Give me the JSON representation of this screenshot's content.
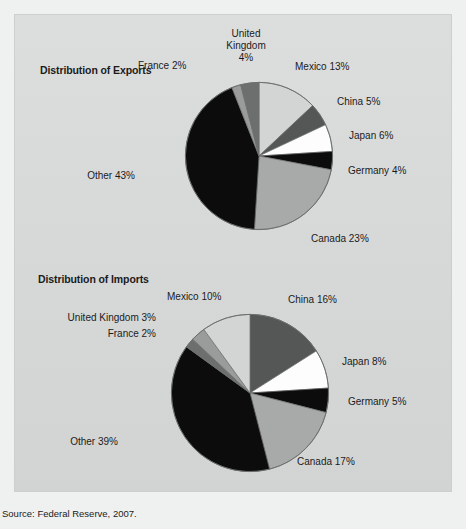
{
  "figure": {
    "source_note": "Source: Federal Reserve, 2007.",
    "background_color": "#d9dbdb",
    "page_color": "#eff0f0"
  },
  "charts": [
    {
      "id": "exports",
      "title": "Distribution of Exports",
      "labels": {
        "france": "France 2%",
        "united_kingdom_line1": "United",
        "united_kingdom_line2": "Kingdom",
        "united_kingdom_line3": "4%",
        "mexico": "Mexico 13%",
        "china": "China 5%",
        "japan": "Japan 6%",
        "germany": "Germany 4%",
        "canada": "Canada 23%",
        "other": "Other 43%"
      }
    },
    {
      "id": "imports",
      "title": "Distribution of Imports",
      "labels": {
        "mexico": "Mexico 10%",
        "united_kingdom": "United Kingdom 3%",
        "france": "France 2%",
        "china": "China 16%",
        "japan": "Japan 8%",
        "germany": "Germany 5%",
        "canada": "Canada 17%",
        "other": "Other 39%"
      }
    }
  ],
  "chart_data": [
    {
      "type": "pie",
      "title": "Distribution of Exports",
      "categories": [
        "Mexico",
        "China",
        "Japan",
        "Germany",
        "Canada",
        "Other",
        "France",
        "United Kingdom"
      ],
      "values": [
        13,
        5,
        6,
        4,
        23,
        43,
        2,
        4
      ],
      "unit": "percent",
      "labels": [
        "Mexico 13%",
        "China 5%",
        "Japan 6%",
        "Germany 4%",
        "Canada 23%",
        "Other 43%",
        "France 2%",
        "United Kingdom 4%"
      ],
      "colors": [
        "#d3d5d5",
        "#555757",
        "#fdfdfd",
        "#0c0c0c",
        "#a8aaaa",
        "#0c0c0c",
        "#9a9c9c",
        "#6d6f6f"
      ],
      "start_angle_deg": 0,
      "direction": "clockwise",
      "legend": "none",
      "grid": false
    },
    {
      "type": "pie",
      "title": "Distribution of Imports",
      "categories": [
        "China",
        "Japan",
        "Germany",
        "Canada",
        "Other",
        "France",
        "United Kingdom",
        "Mexico"
      ],
      "values": [
        16,
        8,
        5,
        17,
        39,
        2,
        3,
        10
      ],
      "unit": "percent",
      "labels": [
        "China 16%",
        "Japan 8%",
        "Germany 5%",
        "Canada 17%",
        "Other 39%",
        "France 2%",
        "United Kingdom 3%",
        "Mexico 10%"
      ],
      "colors": [
        "#555757",
        "#fdfdfd",
        "#0c0c0c",
        "#a8aaaa",
        "#0c0c0c",
        "#6d6f6f",
        "#9a9c9c",
        "#d3d5d5"
      ],
      "start_angle_deg": 0,
      "direction": "clockwise",
      "legend": "none",
      "grid": false
    }
  ]
}
